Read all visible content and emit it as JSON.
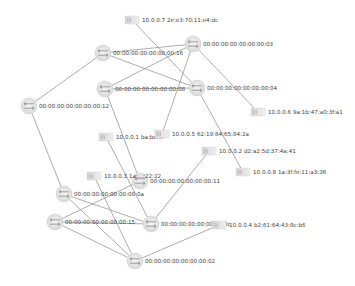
{
  "topology": {
    "switches": [
      {
        "id": "s16",
        "label": "00:00:00:00:00:00:00:16",
        "x": 103,
        "y": 53
      },
      {
        "id": "s03",
        "label": "00:00:00:00:00:00:00:03",
        "x": 193,
        "y": 44
      },
      {
        "id": "s08",
        "label": "00:00:00:00:00:00:00:08",
        "x": 105,
        "y": 89
      },
      {
        "id": "s04",
        "label": "00:00:00:00:00:00:00:04",
        "x": 197,
        "y": 88
      },
      {
        "id": "s12",
        "label": "00:00:00:00:00:00:00:12",
        "x": 29,
        "y": 106
      },
      {
        "id": "s11",
        "label": "00:00:00:00:00:00:00:11",
        "x": 140,
        "y": 181
      },
      {
        "id": "s0a",
        "label": "00:00:00:00:00:00:00:0a",
        "x": 64,
        "y": 194
      },
      {
        "id": "s15",
        "label": "00:00:00:00:00:00:00:15",
        "x": 55,
        "y": 222
      },
      {
        "id": "s0c",
        "label": "00:00:00:00:00:00:00:0c",
        "x": 151,
        "y": 224
      },
      {
        "id": "s02",
        "label": "00:00:00:00:00:00:00:02",
        "x": 135,
        "y": 261
      }
    ],
    "hosts": [
      {
        "id": "h7",
        "label": "10.0.0.7 2e:e3:70:11:e4:dc",
        "x": 132,
        "y": 20
      },
      {
        "id": "h6",
        "label": "10.0.0.6 9a:1b:47:a0:3f:a1",
        "x": 258,
        "y": 112
      },
      {
        "id": "h1",
        "label": "10.0.0.1 ba:bc:...",
        "x": 106,
        "y": 137
      },
      {
        "id": "h5",
        "label": "10.0.0.5 62:19:84:65:84:2a",
        "x": 162,
        "y": 134
      },
      {
        "id": "h2",
        "label": "10.0.0.2 d2:a2:5d:37:4a:41",
        "x": 209,
        "y": 151
      },
      {
        "id": "h8",
        "label": "10.0.0.8 1a:3f:fe:11:a3:36",
        "x": 243,
        "y": 172
      },
      {
        "id": "h3",
        "label": "10.0.0.3 1a:...:22:22",
        "x": 94,
        "y": 176
      },
      {
        "id": "h4",
        "label": "10.0.0.4 b2:61:64:43:8c:b6",
        "x": 219,
        "y": 225
      }
    ],
    "links": [
      [
        "h7",
        "s04"
      ],
      [
        "s16",
        "s03"
      ],
      [
        "s16",
        "s04"
      ],
      [
        "s16",
        "s12"
      ],
      [
        "s03",
        "s08"
      ],
      [
        "s03",
        "h5"
      ],
      [
        "s03",
        "h6"
      ],
      [
        "s08",
        "s04"
      ],
      [
        "s08",
        "s11"
      ],
      [
        "s04",
        "h8"
      ],
      [
        "s12",
        "s0a"
      ],
      [
        "h1",
        "s0c"
      ],
      [
        "h2",
        "s0c"
      ],
      [
        "h3",
        "s02"
      ],
      [
        "s11",
        "s15"
      ],
      [
        "s0a",
        "s0c"
      ],
      [
        "s0a",
        "s02"
      ],
      [
        "s15",
        "s0c"
      ],
      [
        "s15",
        "s02"
      ],
      [
        "s02",
        "h4"
      ]
    ]
  }
}
